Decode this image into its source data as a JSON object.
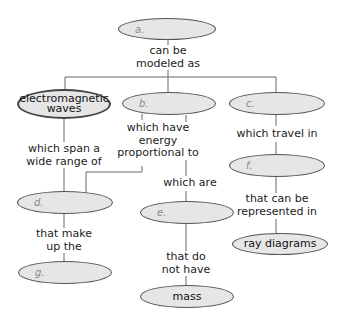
{
  "diagram": {
    "type": "concept-map",
    "nodes": {
      "a": {
        "label": "a."
      },
      "em_waves": {
        "label": "electromagnetic waves",
        "line1": "electromagnetic",
        "line2": "waves"
      },
      "b": {
        "label": "b."
      },
      "c": {
        "label": "c."
      },
      "d": {
        "label": "d."
      },
      "e": {
        "label": "e."
      },
      "f": {
        "label": "f."
      },
      "g": {
        "label": "g."
      },
      "ray_diagrams": {
        "label": "ray diagrams"
      },
      "mass": {
        "label": "mass"
      }
    },
    "links": {
      "can_be_modeled_as": {
        "line1": "can be",
        "line2": "modeled as"
      },
      "which_span": {
        "line1": "which span a",
        "line2": "wide range of"
      },
      "which_have_energy": {
        "line1": "which have",
        "line2": "energy",
        "line3": "proportional to"
      },
      "which_travel_in": {
        "line1": "which travel in"
      },
      "which_are": {
        "line1": "which are"
      },
      "that_can_be_represented": {
        "line1": "that can be",
        "line2": "represented in"
      },
      "that_make_up": {
        "line1": "that make",
        "line2": "up the"
      },
      "that_do_not_have": {
        "line1": "that do",
        "line2": "not have"
      }
    },
    "edges": [
      [
        "a",
        "can_be_modeled_as",
        "em_waves"
      ],
      [
        "a",
        "can_be_modeled_as",
        "b"
      ],
      [
        "a",
        "can_be_modeled_as",
        "c"
      ],
      [
        "em_waves",
        "which_span",
        "d"
      ],
      [
        "b",
        "which_have_energy",
        "d"
      ],
      [
        "b",
        "which_are",
        "e"
      ],
      [
        "c",
        "which_travel_in",
        "f"
      ],
      [
        "f",
        "that_can_be_represented",
        "ray_diagrams"
      ],
      [
        "d",
        "that_make_up",
        "g"
      ],
      [
        "e",
        "that_do_not_have",
        "mass"
      ]
    ],
    "colors": {
      "node_fill": "#e6e6e6",
      "node_border": "#555555",
      "line": "#666666",
      "background": "#ffffff"
    }
  }
}
